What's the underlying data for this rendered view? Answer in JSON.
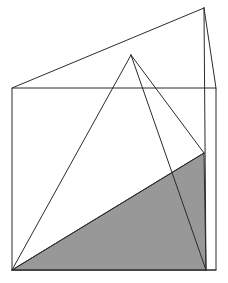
{
  "figure": {
    "type": "line-drawing",
    "canvas": {
      "width": 228,
      "height": 283,
      "background": "#ffffff"
    },
    "style": {
      "stroke_color": "#2b2b2b",
      "stroke_width": 1,
      "shaded_fill": "#989898",
      "shaded_fill_label": "gray"
    },
    "points": {
      "rect_top_left": {
        "x": 12,
        "y": 88,
        "label": "A"
      },
      "rect_top_right": {
        "x": 216,
        "y": 88,
        "label": "B"
      },
      "rect_bottom_right": {
        "x": 216,
        "y": 270,
        "label": "C"
      },
      "rect_bottom_left": {
        "x": 12,
        "y": 270,
        "label": "D"
      },
      "upper_apex": {
        "x": 204,
        "y": 8,
        "label": "E"
      },
      "pyramid_apex": {
        "x": 131,
        "y": 55,
        "label": "F"
      },
      "right_vertical_top": {
        "x": 204,
        "y": 8,
        "label": "G"
      },
      "right_vertical_bot": {
        "x": 204,
        "y": 270,
        "label": "H"
      },
      "shade_top_right": {
        "x": 204,
        "y": 153,
        "label": "I"
      },
      "bottom_convergence": {
        "x": 12,
        "y": 270,
        "label": "J"
      }
    },
    "shapes": [
      {
        "name": "outer-rectangle",
        "kind": "polygon",
        "filled": false,
        "points": "12,88 216,88 216,270 12,270"
      },
      {
        "name": "shaded-triangle",
        "kind": "polygon",
        "filled": true,
        "fill": "#989898",
        "points": "12,270 204,153 206,270"
      }
    ],
    "lines": [
      {
        "name": "apex-to-rect-top-left",
        "x1": 12,
        "y1": 88,
        "x2": 204,
        "y2": 8
      },
      {
        "name": "apex-to-rect-top-right",
        "x1": 204,
        "y1": 8,
        "x2": 216,
        "y2": 88
      },
      {
        "name": "right-vertical-edge",
        "x1": 204,
        "y1": 8,
        "x2": 206,
        "y2": 270
      },
      {
        "name": "pyramid-left-edge",
        "x1": 131,
        "y1": 55,
        "x2": 12,
        "y2": 270
      },
      {
        "name": "pyramid-right-edge",
        "x1": 131,
        "y1": 55,
        "x2": 206,
        "y2": 270
      },
      {
        "name": "pyramid-mid-edge",
        "x1": 131,
        "y1": 55,
        "x2": 204,
        "y2": 153
      },
      {
        "name": "shade-hypotenuse",
        "x1": 12,
        "y1": 270,
        "x2": 204,
        "y2": 153
      },
      {
        "name": "rect-bottom-edge",
        "x1": 12,
        "y1": 270,
        "x2": 216,
        "y2": 270
      }
    ]
  }
}
